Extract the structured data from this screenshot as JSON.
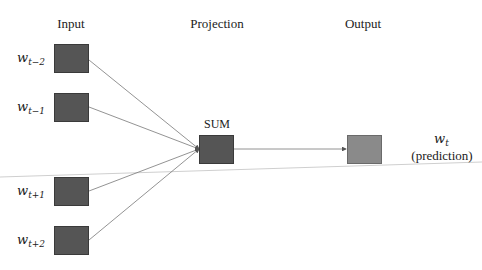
{
  "diagram": {
    "type": "CBOW word2vec architecture",
    "columns": {
      "input": "Input",
      "projection": "Projection",
      "output": "Output"
    },
    "inputs": [
      {
        "base": "w",
        "sub": "t−2"
      },
      {
        "base": "w",
        "sub": "t−1"
      },
      {
        "base": "w",
        "sub": "t+1"
      },
      {
        "base": "w",
        "sub": "t+2"
      }
    ],
    "projection_node": {
      "label": "SUM"
    },
    "output_node": {
      "base": "w",
      "sub": "t",
      "caption": "(prediction)"
    },
    "colors": {
      "input_box": "#555555",
      "sum_box": "#555555",
      "output_box": "#8a8a8a",
      "edge": "#666666",
      "stray_line": "#cfcfcf"
    }
  }
}
